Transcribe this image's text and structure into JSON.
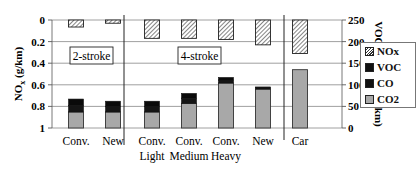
{
  "chart_data": {
    "type": "bar",
    "title": "",
    "xlabel": "",
    "ylabel_left": "NOx (g/km)",
    "ylabel_right": "VOC, CO, CO2 (g/km)",
    "ylim_left": [
      0,
      1
    ],
    "ylim_left_inverted": true,
    "ylim_right": [
      0,
      250
    ],
    "left_ticks": [
      "0",
      "0.2",
      "0.4",
      "0.6",
      "0.8",
      "1"
    ],
    "right_ticks": [
      "250",
      "200",
      "150",
      "100",
      "50",
      "0"
    ],
    "grid": true,
    "legend_position": "right",
    "groups": [
      {
        "label": "2-stroke",
        "categories": [
          "Conv.",
          "New"
        ]
      },
      {
        "label": "4-stroke",
        "categories": [
          "Conv. Light",
          "Conv. Medium",
          "Conv. Heavy",
          "New"
        ]
      },
      {
        "label": "",
        "categories": [
          "Car"
        ]
      }
    ],
    "categories": [
      "Conv.",
      "New",
      "Conv. Light",
      "Conv. Medium",
      "Conv. Heavy",
      "New",
      "Car"
    ],
    "series": [
      {
        "name": "NOx",
        "axis": "left",
        "pattern": "hatched",
        "values": [
          0.065,
          0.03,
          0.17,
          0.17,
          0.18,
          0.23,
          0.31
        ]
      },
      {
        "name": "VOC",
        "axis": "right",
        "color": "#111111",
        "values": [
          15,
          12,
          12,
          11,
          6,
          2,
          0
        ]
      },
      {
        "name": "CO",
        "axis": "right",
        "color": "#111111",
        "values": [
          15,
          13,
          13,
          12,
          7,
          3,
          0
        ]
      },
      {
        "name": "CO2",
        "axis": "right",
        "color": "#a8a8a8",
        "values": [
          37,
          37,
          37,
          57,
          104,
          90,
          135
        ]
      }
    ],
    "annotations": [
      "2-stroke",
      "4-stroke"
    ]
  },
  "labels": {
    "left_ticks": [
      "0",
      "0.2",
      "0.4",
      "0.6",
      "0.8",
      "1"
    ],
    "right_ticks": [
      "250",
      "200",
      "150",
      "100",
      "50",
      "0"
    ],
    "left_axis": "NOx (g/km)",
    "right_axis": "VOC, CO, CO2 (g/km)",
    "cat_line1": [
      "Conv.",
      "New",
      "Conv.",
      "Conv.",
      "Conv.",
      "New",
      "Car"
    ],
    "cat_line2": [
      "",
      "",
      "Light",
      "Medium",
      "Heavy",
      "",
      ""
    ],
    "box_2stroke": "2-stroke",
    "box_4stroke": "4-stroke"
  },
  "legend": {
    "items": [
      {
        "label": "NOx"
      },
      {
        "label": "VOC"
      },
      {
        "label": "CO"
      },
      {
        "label": "CO2"
      }
    ]
  }
}
